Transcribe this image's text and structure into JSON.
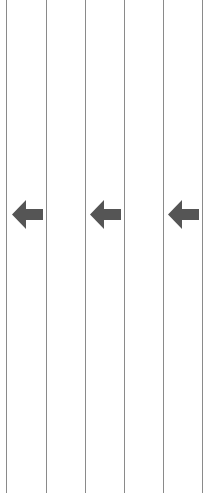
{
  "colors": {
    "background": "#ffffff",
    "line": "#8a8a8a",
    "arrow": "#555555"
  },
  "lines": [
    {
      "x": 6
    },
    {
      "x": 46
    },
    {
      "x": 85
    },
    {
      "x": 124
    },
    {
      "x": 163
    },
    {
      "x": 202
    }
  ],
  "arrows": [
    {
      "icon": "arrow-left-icon",
      "x": 12
    },
    {
      "icon": "arrow-left-icon",
      "x": 90
    },
    {
      "icon": "arrow-left-icon",
      "x": 168
    }
  ]
}
